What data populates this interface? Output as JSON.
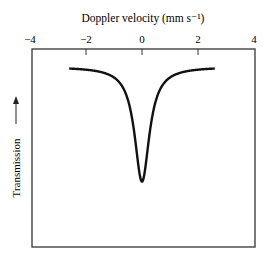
{
  "chart_data": {
    "type": "line",
    "title": "",
    "xlabel": "Doppler velocity (mm s⁻¹)",
    "ylabel": "Transmission",
    "ylabel_arrow": "→",
    "xlim": [
      -4,
      4
    ],
    "x_ticks": [
      -4,
      -2,
      0,
      2,
      4
    ],
    "x_tick_labels": [
      "−4",
      "−2",
      "0",
      "2",
      "4"
    ],
    "x_tick_marks": [
      -2,
      0,
      2
    ],
    "y_ticks": [],
    "grid": false,
    "legend": null,
    "xaxis_position": "top",
    "series": [
      {
        "name": "Mössbauer absorption line (Lorentzian)",
        "shape": "lorentzian_dip",
        "center": 0,
        "x_range": [
          -2.6,
          2.6
        ],
        "baseline_fraction": 0.91,
        "min_fraction": 0.33,
        "hwhm": 0.32,
        "color": "#111111"
      }
    ]
  },
  "frame": {
    "left": 32,
    "right": 255,
    "top": 49,
    "bottom": 247
  }
}
